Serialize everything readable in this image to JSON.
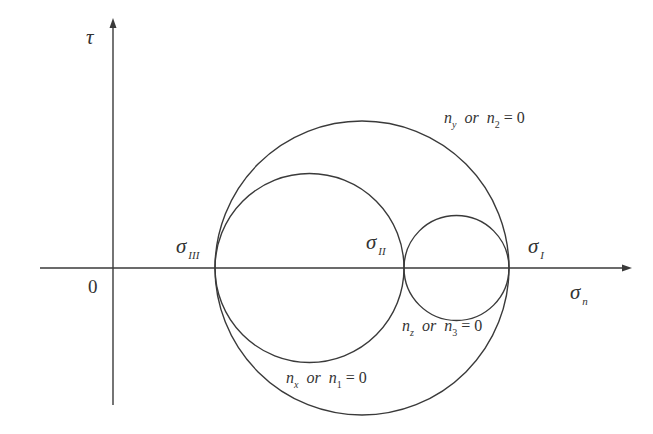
{
  "figure": {
    "type": "mohr_circle_diagram",
    "axes": {
      "vertical_label": "τ",
      "horizontal_label_symbol": "σ",
      "horizontal_label_sub": "n",
      "origin_label": "0"
    },
    "principal_stresses": [
      {
        "symbol": "σ",
        "sub": "III"
      },
      {
        "symbol": "σ",
        "sub": "II"
      },
      {
        "symbol": "σ",
        "sub": "I"
      }
    ],
    "circles": [
      {
        "name": "outer",
        "label_a": "n",
        "label_a_sub": "y",
        "or": "or",
        "label_b": "n",
        "label_b_sub": "2",
        "eq": "= 0"
      },
      {
        "name": "left",
        "label_a": "n",
        "label_a_sub": "x",
        "or": "or",
        "label_b": "n",
        "label_b_sub": "1",
        "eq": "= 0"
      },
      {
        "name": "right",
        "label_a": "n",
        "label_a_sub": "z",
        "or": "or",
        "label_b": "n",
        "label_b_sub": "3",
        "eq": "= 0"
      }
    ],
    "colors": {
      "line": "#3a3a3a",
      "text": "#333333"
    }
  }
}
